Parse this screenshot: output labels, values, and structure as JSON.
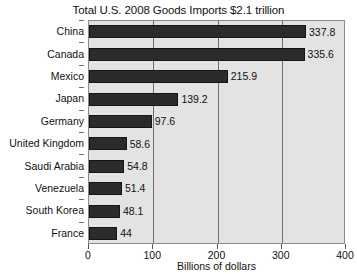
{
  "chart_data": {
    "type": "bar",
    "orientation": "horizontal",
    "title": "Total U.S. 2008 Goods Imports $2.1 trillion",
    "xlabel": "Billions of dollars",
    "ylabel": "",
    "xlim": [
      0,
      400
    ],
    "xticks": [
      0,
      100,
      200,
      300,
      400
    ],
    "xtick_labels": [
      "0",
      "100",
      "200",
      "300",
      "400"
    ],
    "grid": true,
    "grid_axis": "x",
    "legend": false,
    "categories": [
      "China",
      "Canada",
      "Mexico",
      "Japan",
      "Germany",
      "United Kingdom",
      "Saudi Arabia",
      "Venezuela",
      "South Korea",
      "France"
    ],
    "values": [
      337.8,
      335.6,
      215.9,
      139.2,
      97.6,
      58.6,
      54.8,
      51.4,
      48.1,
      44
    ],
    "value_labels": [
      "337.8",
      "335.6",
      "215.9",
      "139.2",
      "97.6",
      "58.6",
      "54.8",
      "51.4",
      "48.1",
      "44"
    ],
    "colors": {
      "bar_fill": "#2b2b2b",
      "bar_edge": "#151515",
      "plot_background": "#e3e3e3",
      "figure_background": "#ffffff",
      "gridline": "#6e6e6e",
      "axis": "#8a8a8a",
      "text": "#111111"
    }
  }
}
